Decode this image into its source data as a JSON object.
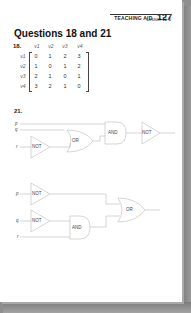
{
  "header": {
    "teaching_aid_label": "TEACHING AID",
    "teaching_aid_number": "127",
    "lesson": "Lesson 11-5"
  },
  "title": "Questions 18 and 21",
  "question18": {
    "number": "18.",
    "column_headers": [
      "v1",
      "v2",
      "v3",
      "v4"
    ],
    "row_headers": [
      "v1",
      "v2",
      "v3",
      "v4"
    ],
    "matrix": [
      [
        0,
        1,
        2,
        3
      ],
      [
        1,
        0,
        1,
        2
      ],
      [
        2,
        1,
        0,
        1
      ],
      [
        3,
        2,
        1,
        0
      ]
    ]
  },
  "question21": {
    "number": "21.",
    "circuit1": {
      "inputs": [
        "p",
        "q",
        "r"
      ],
      "gates": [
        "NOT",
        "OR",
        "AND",
        "NOT"
      ]
    },
    "circuit2": {
      "inputs": [
        "p",
        "q",
        "r"
      ],
      "gates": [
        "NOT",
        "NOT",
        "AND",
        "OR"
      ]
    }
  },
  "colors": {
    "page": "#ffffff",
    "shadow": "#8f8f8f",
    "text": "#222222",
    "wire": "#bbbbbb"
  }
}
